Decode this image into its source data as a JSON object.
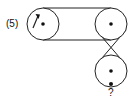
{
  "diagram": {
    "type": "pulley-belt-system",
    "pulleys": [
      {
        "id": "left",
        "label": "(5)",
        "rotation": "clockwise",
        "cx": 43,
        "cy": 24,
        "r": 16
      },
      {
        "id": "right-top",
        "label": "",
        "cx": 111,
        "cy": 24,
        "r": 16
      },
      {
        "id": "right-bottom",
        "label": "?",
        "cx": 111,
        "cy": 71,
        "r": 16
      }
    ],
    "belts": [
      {
        "from": "left",
        "to": "right-top",
        "style": "open"
      },
      {
        "from": "right-top",
        "to": "right-bottom",
        "style": "crossed"
      }
    ],
    "labels": {
      "given_speed": "(5)",
      "unknown": "?"
    },
    "colors": {
      "stroke": "#222222",
      "background": "#ffffff"
    }
  }
}
